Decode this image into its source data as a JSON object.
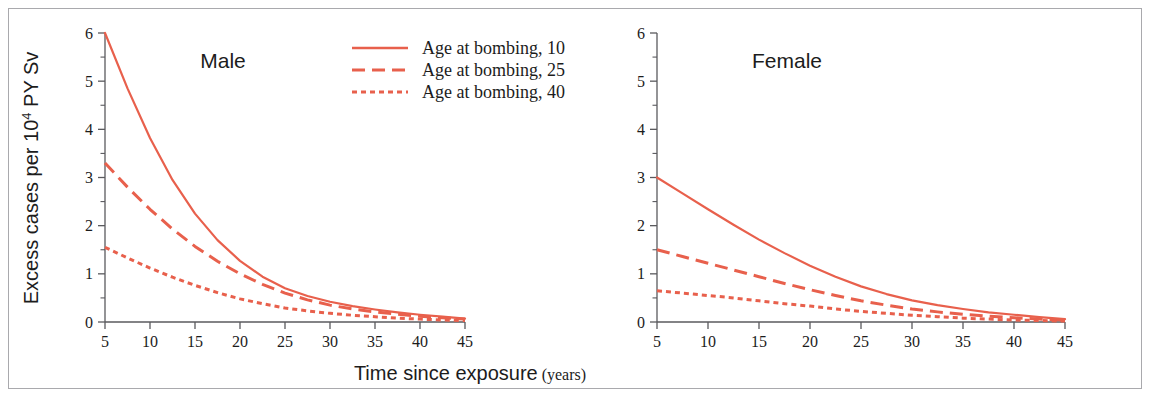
{
  "figure": {
    "axis_color": "#5a5a5e",
    "frame_color": "#a9a9ad",
    "series_color": "#e8604c",
    "background": "#ffffff",
    "xlabel_main": "Time since exposure",
    "xlabel_unit": "(years)"
  },
  "legend": {
    "position": "top-center",
    "entries": [
      {
        "label": "Age at bombing, 10",
        "style": "solid"
      },
      {
        "label": "Age at bombing, 25",
        "style": "dashed"
      },
      {
        "label": "Age at bombing, 40",
        "style": "dotted"
      }
    ]
  },
  "chart_data": {
    "type": "line",
    "title": "",
    "xlabel": "Time since exposure (years)",
    "ylabel": "Excess cases per 10⁴ PY Sv",
    "xlim": [
      5,
      45
    ],
    "ylim": [
      0,
      6
    ],
    "xticks": [
      5,
      10,
      15,
      20,
      25,
      30,
      35,
      40,
      45
    ],
    "yticks": [
      0,
      1,
      2,
      3,
      4,
      5,
      6
    ],
    "minor_y_step": 0.5,
    "grid": false,
    "legend_position": "top-center",
    "panels": [
      {
        "name": "Male",
        "x": [
          5,
          7.5,
          10,
          12.5,
          15,
          17.5,
          20,
          22.5,
          25,
          27.5,
          30,
          32.5,
          35,
          37.5,
          40,
          42.5,
          45
        ],
        "series": [
          {
            "name": "Age at bombing, 10",
            "style": "solid",
            "values": [
              6.0,
              4.85,
              3.82,
              2.95,
              2.25,
              1.7,
              1.27,
              0.94,
              0.7,
              0.54,
              0.42,
              0.33,
              0.26,
              0.2,
              0.15,
              0.11,
              0.07
            ]
          },
          {
            "name": "Age at bombing, 25",
            "style": "dashed",
            "values": [
              3.3,
              2.8,
              2.34,
              1.93,
              1.57,
              1.26,
              1.0,
              0.78,
              0.6,
              0.46,
              0.35,
              0.27,
              0.21,
              0.16,
              0.12,
              0.09,
              0.06
            ]
          },
          {
            "name": "Age at bombing, 40",
            "style": "dotted",
            "values": [
              1.55,
              1.33,
              1.12,
              0.93,
              0.76,
              0.61,
              0.48,
              0.38,
              0.29,
              0.23,
              0.18,
              0.14,
              0.11,
              0.08,
              0.06,
              0.04,
              0.03
            ]
          }
        ]
      },
      {
        "name": "Female",
        "x": [
          5,
          7.5,
          10,
          12.5,
          15,
          17.5,
          20,
          22.5,
          25,
          27.5,
          30,
          32.5,
          35,
          37.5,
          40,
          42.5,
          45
        ],
        "series": [
          {
            "name": "Age at bombing, 10",
            "style": "solid",
            "values": [
              3.0,
              2.67,
              2.34,
              2.02,
              1.71,
              1.43,
              1.17,
              0.94,
              0.74,
              0.58,
              0.45,
              0.35,
              0.27,
              0.2,
              0.15,
              0.1,
              0.06
            ]
          },
          {
            "name": "Age at bombing, 25",
            "style": "dashed",
            "values": [
              1.5,
              1.36,
              1.22,
              1.08,
              0.94,
              0.8,
              0.67,
              0.55,
              0.44,
              0.35,
              0.27,
              0.21,
              0.16,
              0.12,
              0.09,
              0.06,
              0.04
            ]
          },
          {
            "name": "Age at bombing, 40",
            "style": "dotted",
            "values": [
              0.65,
              0.6,
              0.55,
              0.5,
              0.44,
              0.38,
              0.33,
              0.27,
              0.22,
              0.18,
              0.14,
              0.11,
              0.08,
              0.06,
              0.04,
              0.03,
              0.02
            ]
          }
        ]
      }
    ]
  },
  "labels": {
    "panel_male": "Male",
    "panel_female": "Female",
    "ylabel_prefix": "Excess cases per 10",
    "ylabel_sup": "4",
    "ylabel_suffix": " PY Sv",
    "xtick_5": "5",
    "xtick_10": "10",
    "xtick_15": "15",
    "xtick_20": "20",
    "xtick_25": "25",
    "xtick_30": "30",
    "xtick_35": "35",
    "xtick_40": "40",
    "xtick_45": "45",
    "ytick_0": "0",
    "ytick_1": "1",
    "ytick_2": "2",
    "ytick_3": "3",
    "ytick_4": "4",
    "ytick_5": "5",
    "ytick_6": "6"
  }
}
